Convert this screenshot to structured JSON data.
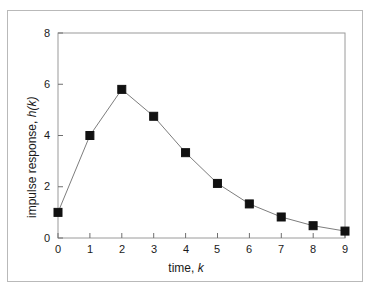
{
  "chart_data": {
    "type": "line",
    "title": "",
    "subtitle": "",
    "xlabel": "time, k",
    "xlabel_plain": "time,",
    "xlabel_italic": "k",
    "ylabel": "impulse response, h(k)",
    "ylabel_plain": "impulse response,",
    "ylabel_italic": "h(k)",
    "x": [
      0,
      1,
      2,
      3,
      4,
      5,
      6,
      7,
      8,
      9
    ],
    "values": [
      1.0,
      4.0,
      5.8,
      4.75,
      3.33,
      2.13,
      1.33,
      0.82,
      0.48,
      0.27
    ],
    "series": [
      {
        "name": "impulse response",
        "values": [
          1.0,
          4.0,
          5.8,
          4.75,
          3.33,
          2.13,
          1.33,
          0.82,
          0.48,
          0.27
        ]
      }
    ],
    "xlim": [
      0,
      9
    ],
    "ylim": [
      0,
      8
    ],
    "xticks": [
      0,
      1,
      2,
      3,
      4,
      5,
      6,
      7,
      8,
      9
    ],
    "xtick_labels": [
      "0",
      "1",
      "2",
      "3",
      "4",
      "5",
      "6",
      "7",
      "8",
      "9"
    ],
    "yticks": [
      0,
      2,
      4,
      6,
      8
    ],
    "ytick_labels": [
      "0",
      "2",
      "4",
      "6",
      "8"
    ],
    "grid": false,
    "legend": null,
    "legend_position": "none",
    "marker": "square",
    "marker_color": "#111111",
    "line_color": "#7d7d7d",
    "axis_color": "#9a9a9a",
    "frame_color": "#b9b9b9",
    "background_color": "#ffffff",
    "annotations": []
  }
}
